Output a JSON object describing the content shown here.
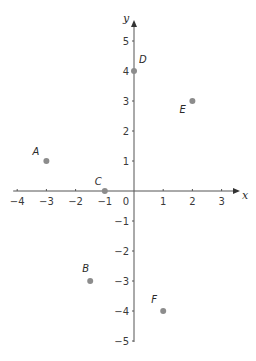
{
  "chart_data": {
    "type": "scatter",
    "title": "",
    "xlabel": "x",
    "ylabel": "y",
    "xlim": [
      -4,
      3
    ],
    "ylim": [
      -5,
      5
    ],
    "grid": false,
    "x_ticks": [
      -4,
      -3,
      -2,
      -1,
      0,
      1,
      2,
      3
    ],
    "y_ticks": [
      -5,
      -4,
      -3,
      -2,
      -1,
      1,
      2,
      3,
      4,
      5
    ],
    "origin_label": "0",
    "points": [
      {
        "label": "A",
        "x": -3,
        "y": 1
      },
      {
        "label": "B",
        "x": -1.5,
        "y": -3
      },
      {
        "label": "C",
        "x": -1,
        "y": 0
      },
      {
        "label": "D",
        "x": 0,
        "y": 4
      },
      {
        "label": "E",
        "x": 2,
        "y": 3
      },
      {
        "label": "F",
        "x": 1,
        "y": -4
      }
    ],
    "point_color": "#8c8c8c",
    "axis_color": "#555555"
  }
}
